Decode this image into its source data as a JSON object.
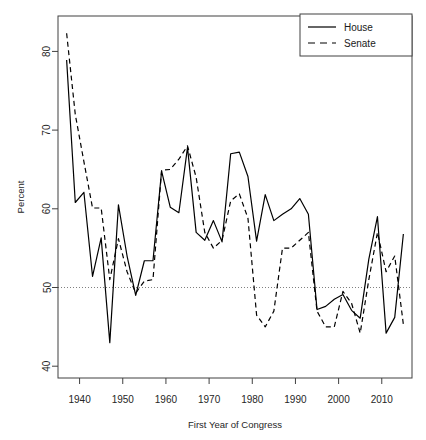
{
  "chart_data": {
    "type": "line",
    "title": "",
    "xlabel": "First Year of Congress",
    "ylabel": "Percent",
    "xlim": [
      1935,
      2017
    ],
    "ylim": [
      38.5,
      84.5
    ],
    "xticks": [
      1940,
      1950,
      1960,
      1970,
      1980,
      1990,
      2000,
      2010
    ],
    "yticks": [
      40,
      50,
      60,
      70,
      80
    ],
    "grid": false,
    "reference_line": {
      "y": 50,
      "style": "dotted",
      "color": "#808080"
    },
    "legend": {
      "position": "top-right",
      "entries": [
        {
          "name": "House",
          "style": "solid"
        },
        {
          "name": "Senate",
          "style": "dashed"
        }
      ]
    },
    "x": [
      1937,
      1939,
      1941,
      1943,
      1945,
      1947,
      1949,
      1951,
      1953,
      1955,
      1957,
      1959,
      1961,
      1963,
      1965,
      1967,
      1969,
      1971,
      1973,
      1975,
      1977,
      1979,
      1981,
      1983,
      1985,
      1987,
      1989,
      1991,
      1993,
      1995,
      1997,
      1999,
      2001,
      2003,
      2005,
      2007,
      2009,
      2011,
      2013,
      2015
    ],
    "series": [
      {
        "name": "House",
        "style": "solid",
        "color": "#000000",
        "values": [
          78.9,
          60.8,
          62.1,
          51.4,
          56.3,
          43.0,
          60.5,
          54.0,
          49.0,
          53.4,
          53.4,
          64.8,
          60.2,
          59.5,
          67.8,
          57.0,
          56.0,
          58.5,
          55.8,
          67.0,
          67.2,
          64.1,
          55.9,
          61.8,
          58.5,
          59.3,
          60.0,
          61.3,
          59.3,
          47.2,
          47.6,
          48.5,
          49.1,
          47.1,
          46.1,
          53.6,
          59.0,
          44.2,
          46.2,
          56.8
        ]
      },
      {
        "name": "Senate",
        "style": "dashed",
        "color": "#000000",
        "values": [
          82.3,
          72.0,
          66.0,
          60.1,
          60.1,
          51.0,
          56.2,
          52.0,
          49.3,
          50.8,
          51.0,
          64.9,
          65.0,
          66.3,
          68.0,
          64.0,
          57.0,
          55.0,
          56.0,
          61.0,
          61.9,
          58.8,
          46.5,
          45.0,
          47.0,
          55.0,
          55.0,
          56.0,
          57.0,
          47.0,
          45.0,
          45.0,
          49.5,
          48.0,
          44.2,
          51.0,
          57.0,
          52.0,
          54.0,
          45.3
        ]
      }
    ]
  }
}
